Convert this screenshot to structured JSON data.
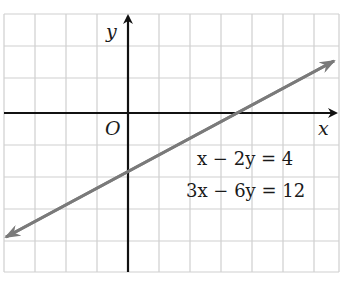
{
  "diagram": {
    "type": "coordinate-graph",
    "axes": {
      "x_label": "x",
      "y_label": "y",
      "origin_label": "O"
    },
    "equations": [
      "x − 2y = 4",
      "3x − 6y = 12"
    ],
    "line": {
      "x_intercept": 4,
      "y_intercept": -2,
      "slope": 0.5,
      "color": "#7a7a7a"
    },
    "grid": {
      "color": "#cfcfcf",
      "x_range": [
        -4,
        7
      ],
      "y_range": [
        -5,
        3
      ]
    }
  }
}
